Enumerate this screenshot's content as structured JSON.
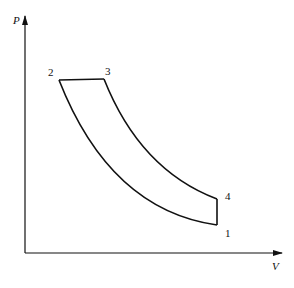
{
  "diagram": {
    "type": "pv-cycle",
    "axes": {
      "y_label": "P",
      "x_label": "V"
    },
    "points": [
      {
        "id": "1",
        "label": "1"
      },
      {
        "id": "2",
        "label": "2"
      },
      {
        "id": "3",
        "label": "3"
      },
      {
        "id": "4",
        "label": "4"
      }
    ],
    "processes": [
      {
        "from": "1",
        "to": "2",
        "shape": "curve"
      },
      {
        "from": "2",
        "to": "3",
        "shape": "horizontal-line"
      },
      {
        "from": "3",
        "to": "4",
        "shape": "curve"
      },
      {
        "from": "4",
        "to": "1",
        "shape": "vertical-line"
      }
    ]
  }
}
